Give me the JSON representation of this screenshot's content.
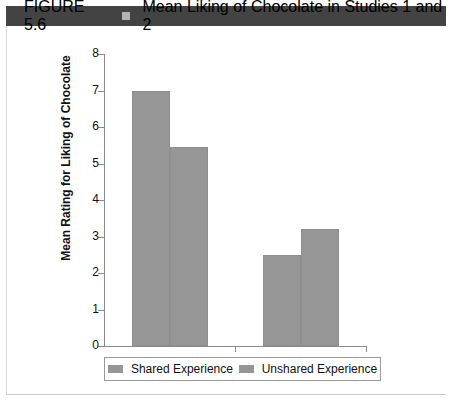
{
  "header": {
    "figure_number": "FIGURE 5.6",
    "separator_icon": "square-glyph",
    "title": "Mean Liking of Chocolate in Studies 1 and 2",
    "bar_color": "#434343",
    "text_color": "#ffffff"
  },
  "caption": {
    "text": ""
  },
  "chart_data": {
    "type": "bar",
    "title": "Mean Liking of Chocolate in Studies 1 and 2",
    "xlabel": "",
    "ylabel": "Mean Rating for Liking of Chocolate",
    "categories": [
      "Study 1",
      "Study 2"
    ],
    "series": [
      {
        "name": "Shared Experience",
        "values": [
          7.0,
          2.5
        ],
        "color": "#969696"
      },
      {
        "name": "Unshared Experience",
        "values": [
          5.45,
          3.2
        ],
        "color": "#969696"
      }
    ],
    "ylim": [
      0,
      8
    ],
    "yticks": [
      0,
      1,
      2,
      3,
      4,
      5,
      6,
      7,
      8
    ],
    "ytick_labels": [
      "0",
      "1",
      "2",
      "3",
      "4",
      "5",
      "6",
      "7",
      "8"
    ],
    "grid": false,
    "legend_position": "bottom"
  }
}
